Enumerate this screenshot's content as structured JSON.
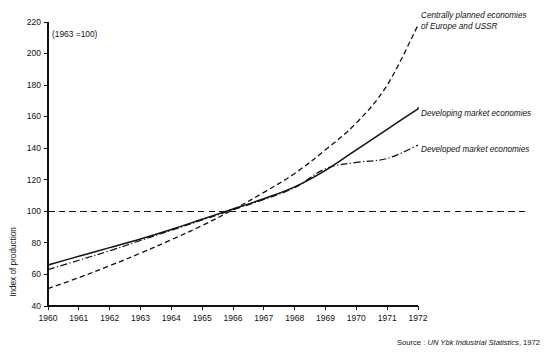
{
  "chart_data": {
    "type": "line",
    "title": "",
    "subtitle": "",
    "annotation": "(1963 =100)",
    "xlabel": "",
    "ylabel": "Index of production",
    "source": "Source : UN Ybk Industrial Statistics, 1972",
    "source_prefix": "Source : ",
    "source_italic": "UN Ybk Industrial Statistics",
    "source_suffix": ", 1972",
    "grid": false,
    "legend_position": "right-inline-labels",
    "xlim": [
      1960,
      1972
    ],
    "ylim": [
      40,
      220
    ],
    "yticks": [
      40,
      60,
      80,
      100,
      120,
      140,
      160,
      180,
      200,
      220
    ],
    "ytick_labels": [
      "40",
      "60",
      "80",
      "100",
      "120",
      "140",
      "160",
      "180",
      "200",
      "220"
    ],
    "x": [
      1960,
      1961,
      1962,
      1963,
      1964,
      1965,
      1966,
      1967,
      1968,
      1969,
      1970,
      1971,
      1972
    ],
    "xtick_labels": [
      "1960",
      "1961",
      "1962",
      "1963",
      "1964",
      "1965",
      "1966",
      "1967",
      "1968",
      "1969",
      "1970",
      "1971",
      "1972"
    ],
    "reference_line": {
      "value": 100,
      "style": "dashed",
      "label": "(1963 =100)"
    },
    "series": [
      {
        "name": "Centrally planned economies of Europe and USSR",
        "label_line_1": "Centrally planned economies",
        "label_line_2": "of Europe and USSR",
        "style": "dashed",
        "values": [
          51,
          58,
          65.5,
          73.5,
          82,
          91,
          101,
          112,
          124,
          139,
          156,
          180,
          218
        ]
      },
      {
        "name": "Developing market economies",
        "label_line_1": "Developing market economies",
        "label_line_2": "",
        "style": "solid",
        "values": [
          66,
          71.5,
          77,
          82.5,
          88.5,
          95,
          101.5,
          108,
          115.5,
          126,
          139,
          152,
          165
        ]
      },
      {
        "name": "Developed market economies",
        "label_line_1": "Developed market economies",
        "label_line_2": "",
        "style": "dash-dot",
        "values": [
          63,
          69,
          75,
          81.5,
          88,
          94.5,
          101,
          107.5,
          115,
          127,
          131,
          133.5,
          142
        ]
      }
    ]
  },
  "figure": {
    "axes": {
      "y_axis_name": "y-axis",
      "x_axis_name": "x-axis"
    }
  }
}
